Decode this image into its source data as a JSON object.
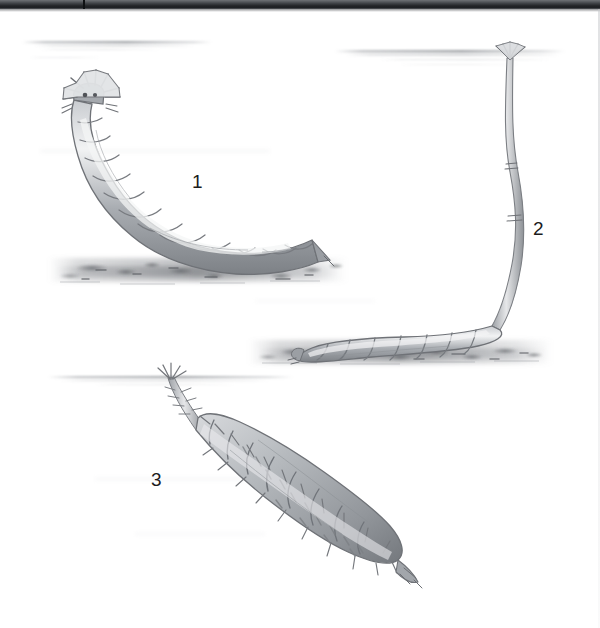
{
  "plate": {
    "title": "Aquatic fly larvae plate",
    "description": "Pencil-style natural history illustration of three aquatic dipteran larvae shown in an underwater cross-section with water-surface lines and a silty bottom.",
    "background_color": "#ffffff",
    "ink_color": "#6e7176",
    "label_color": "#1c1c1c",
    "width": 600,
    "height": 628
  },
  "scan_edge": {
    "name": "page-scan-bar",
    "color_dark": "#26282b",
    "color_light": "#6f7276",
    "height_px": 9
  },
  "figures": [
    {
      "id": 1,
      "label": "1",
      "name": "larva-1",
      "common_name": "crowned head larva resting on the bottom",
      "posture": "curved, head raised, crown of spines at anterior end",
      "label_x": 192,
      "label_y": 172
    },
    {
      "id": 2,
      "label": "2",
      "name": "larva-2",
      "common_name": "rat-tailed maggot with long breathing siphon",
      "posture": "body on substrate, siphon extended to water surface",
      "label_x": 533,
      "label_y": 219
    },
    {
      "id": 3,
      "label": "3",
      "name": "larva-3",
      "common_name": "bristly larva suspended from the surface film",
      "posture": "hanging head-up from water surface, body angled down-right",
      "label_x": 151,
      "label_y": 470
    }
  ],
  "scene": {
    "water_lines": [
      {
        "name": "water-surface-upper-left",
        "y": 43
      },
      {
        "name": "water-surface-upper-right",
        "y": 52
      },
      {
        "name": "water-surface-lower-left",
        "y": 377
      }
    ],
    "substrates": [
      {
        "name": "substrate-band-upper-left",
        "y": 268
      },
      {
        "name": "substrate-band-middle-right",
        "y": 352
      }
    ]
  }
}
